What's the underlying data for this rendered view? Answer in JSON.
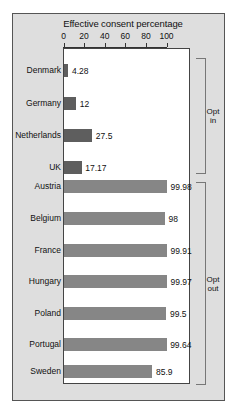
{
  "chart_data": {
    "type": "bar",
    "orientation": "horizontal",
    "title": "Effective consent percentage",
    "xlabel": "",
    "ylabel": "",
    "xlim": [
      0,
      100
    ],
    "xticks": [
      0,
      20,
      40,
      60,
      80,
      100
    ],
    "grid": false,
    "legend": "none",
    "categories": [
      "Denmark",
      "Germany",
      "Netherlands",
      "UK",
      "Austria",
      "Belgium",
      "France",
      "Hungary",
      "Poland",
      "Portugal",
      "Sweden"
    ],
    "values": [
      4.28,
      12,
      27.5,
      17.17,
      99.98,
      98,
      99.91,
      99.97,
      99.5,
      99.64,
      85.9
    ],
    "value_labels": [
      "4.28",
      "12",
      "27.5",
      "17.17",
      "99.98",
      "98",
      "99.91",
      "99.97",
      "99.5",
      "99.64",
      "85.9"
    ],
    "groups": [
      {
        "name": "Opt in",
        "label": "Opt\nin",
        "categories": [
          "Denmark",
          "Germany",
          "Netherlands",
          "UK"
        ],
        "color": "#5e5e5e"
      },
      {
        "name": "Opt out",
        "label": "Opt\nout",
        "categories": [
          "Austria",
          "Belgium",
          "France",
          "Hungary",
          "Poland",
          "Portugal",
          "Sweden"
        ],
        "color": "#868686"
      }
    ],
    "bars": [
      {
        "category": "Denmark",
        "value": 4.28,
        "label": "4.28",
        "group": "Opt in",
        "color": "#5e5e5e"
      },
      {
        "category": "Germany",
        "value": 12,
        "label": "12",
        "group": "Opt in",
        "color": "#5e5e5e"
      },
      {
        "category": "Netherlands",
        "value": 27.5,
        "label": "27.5",
        "group": "Opt in",
        "color": "#5e5e5e"
      },
      {
        "category": "UK",
        "value": 17.17,
        "label": "17.17",
        "group": "Opt in",
        "color": "#5e5e5e"
      },
      {
        "category": "Austria",
        "value": 99.98,
        "label": "99.98",
        "group": "Opt out",
        "color": "#868686"
      },
      {
        "category": "Belgium",
        "value": 98,
        "label": "98",
        "group": "Opt out",
        "color": "#868686"
      },
      {
        "category": "France",
        "value": 99.91,
        "label": "99.91",
        "group": "Opt out",
        "color": "#868686"
      },
      {
        "category": "Hungary",
        "value": 99.97,
        "label": "99.97",
        "group": "Opt out",
        "color": "#868686"
      },
      {
        "category": "Poland",
        "value": 99.5,
        "label": "99.5",
        "group": "Opt out",
        "color": "#868686"
      },
      {
        "category": "Portugal",
        "value": 99.64,
        "label": "99.64",
        "group": "Opt out",
        "color": "#868686"
      },
      {
        "category": "Sweden",
        "value": 85.9,
        "label": "85.9",
        "group": "Opt out",
        "color": "#868686"
      }
    ]
  },
  "colors": {
    "panel_background": "#dedede",
    "plot_background": "#ffffff",
    "opt_in_bar": "#5e5e5e",
    "opt_out_bar": "#868686",
    "axis": "#333333",
    "text": "#111111",
    "bracket": "#777777"
  }
}
